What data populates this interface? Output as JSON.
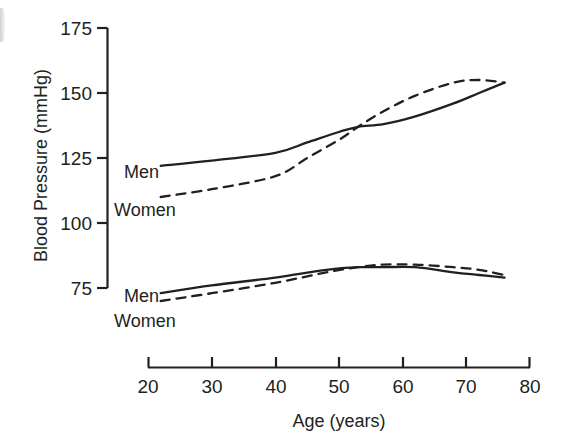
{
  "figure": {
    "background_color": "#ffffff",
    "ink_color": "#231f20"
  },
  "chart_data": {
    "type": "line",
    "title": "",
    "xlabel": "Age (years)",
    "ylabel": "Blood Pressure (mmHg)",
    "xlim": [
      20,
      80
    ],
    "ylim": [
      75,
      175
    ],
    "xticks": [
      20,
      30,
      40,
      50,
      60,
      70,
      80
    ],
    "xtick_labels": [
      "20",
      "30",
      "40",
      "50",
      "60",
      "70",
      "80"
    ],
    "yticks": [
      75,
      100,
      125,
      150,
      175
    ],
    "ytick_labels": [
      "75",
      "100",
      "125",
      "150",
      "175"
    ],
    "grid": false,
    "legend": "inline-labels",
    "series": [
      {
        "name": "Men",
        "measure": "systolic",
        "line_style": "solid",
        "color": "#231f20",
        "label_text": "Men",
        "x": [
          22,
          30,
          40,
          45,
          50,
          53,
          57,
          62,
          68,
          72,
          76
        ],
        "values": [
          122,
          124,
          127,
          131,
          135,
          137,
          138,
          141,
          146,
          150,
          154
        ]
      },
      {
        "name": "Women",
        "measure": "systolic",
        "line_style": "dashed",
        "color": "#231f20",
        "label_text": "Women",
        "x": [
          22,
          30,
          40,
          45,
          50,
          53,
          57,
          62,
          68,
          72,
          76
        ],
        "values": [
          110,
          113,
          118,
          125,
          132,
          137,
          143,
          149,
          154,
          155,
          154
        ]
      },
      {
        "name": "Men",
        "measure": "diastolic",
        "line_style": "solid",
        "color": "#231f20",
        "label_text": "Men",
        "x": [
          22,
          30,
          40,
          48,
          53,
          57,
          62,
          68,
          72,
          76
        ],
        "values": [
          73,
          76,
          79,
          82,
          83,
          83,
          83,
          81,
          80,
          79
        ]
      },
      {
        "name": "Women",
        "measure": "diastolic",
        "line_style": "dashed",
        "color": "#231f20",
        "label_text": "Women",
        "x": [
          22,
          30,
          40,
          48,
          53,
          57,
          62,
          68,
          72,
          76
        ],
        "values": [
          70,
          73,
          77,
          81,
          83,
          84,
          84,
          83,
          82,
          80
        ]
      }
    ],
    "annotations": [
      {
        "name": "systolic-men-label",
        "text": "Men",
        "x": 22,
        "y": 122
      },
      {
        "name": "systolic-women-label",
        "text": "Women",
        "x": 22,
        "y": 110
      },
      {
        "name": "diastolic-men-label",
        "text": "Men",
        "x": 22,
        "y": 73
      },
      {
        "name": "diastolic-women-label",
        "text": "Women",
        "x": 22,
        "y": 68
      }
    ]
  }
}
